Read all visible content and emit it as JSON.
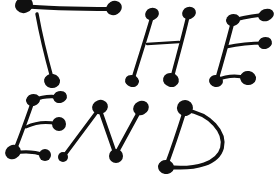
{
  "image": {
    "kind": "hand-drawn-lettering",
    "title": "THE END",
    "width": 274,
    "height": 174,
    "background_color": "#ffffff",
    "ink_color": "#101010",
    "description": "Hand-drawn block lettering reading THE END over two lines, each stroke ending in a thick round blob"
  },
  "text": {
    "line1": "THE",
    "line2": "END",
    "full": "THE END"
  },
  "letters": [
    {
      "char": "T",
      "line": 1,
      "strokes": [
        {
          "name": "t-crossbar",
          "d": "M 24 6 C 50 9, 86 9, 113 9"
        },
        {
          "name": "t-stem",
          "d": "M 37 14 C 41 36, 47 60, 52 78"
        }
      ],
      "nodes": [
        {
          "name": "t-crossbar-left-blob",
          "cx": 24,
          "cy": 5,
          "rx": 9,
          "ry": 8,
          "rot": -18
        },
        {
          "name": "t-crossbar-right-blob",
          "cx": 114,
          "cy": 8,
          "rx": 8,
          "ry": 7,
          "rot": -30
        },
        {
          "name": "t-stem-bottom-blob",
          "cx": 52,
          "cy": 81,
          "rx": 8,
          "ry": 7,
          "rot": 10
        }
      ]
    },
    {
      "char": "H",
      "line": 1,
      "strokes": [
        {
          "name": "h-left-stem",
          "d": "M 152 17 C 146 38, 138 62, 133 79"
        },
        {
          "name": "h-right-stem",
          "d": "M 188 16 C 183 38, 176 62, 172 78"
        },
        {
          "name": "h-crossbar",
          "d": "M 147 44 L 179 42"
        }
      ],
      "nodes": [
        {
          "name": "h-left-top-blob",
          "cx": 152,
          "cy": 14,
          "rx": 7,
          "ry": 6,
          "rot": -20
        },
        {
          "name": "h-right-top-blob",
          "cx": 189,
          "cy": 13,
          "rx": 7,
          "ry": 6,
          "rot": -20
        },
        {
          "name": "h-left-bottom-blob",
          "cx": 132,
          "cy": 81,
          "rx": 7,
          "ry": 6,
          "rot": 15
        },
        {
          "name": "h-right-bottom-blob",
          "cx": 171,
          "cy": 80,
          "rx": 8,
          "ry": 7,
          "rot": 15
        }
      ]
    },
    {
      "char": "E",
      "line": 1,
      "strokes": [
        {
          "name": "e1-spine",
          "d": "M 233 21 C 228 40, 222 62, 217 79"
        },
        {
          "name": "e1-top-arm",
          "d": "M 234 20 C 246 17, 257 15, 265 15"
        },
        {
          "name": "e1-middle-arm",
          "d": "M 226 47 C 240 44, 255 43, 264 43"
        },
        {
          "name": "e1-bottom-arm",
          "d": "M 217 80 C 228 75, 240 76, 247 78"
        }
      ],
      "nodes": [
        {
          "name": "e1-top-corner-blob",
          "cx": 233,
          "cy": 20,
          "rx": 7,
          "ry": 6,
          "rot": -15
        },
        {
          "name": "e1-top-arm-blob",
          "cx": 266,
          "cy": 15,
          "rx": 8,
          "ry": 6,
          "rot": -20
        },
        {
          "name": "e1-middle-arm-blob",
          "cx": 265,
          "cy": 43,
          "rx": 7,
          "ry": 6,
          "rot": -15
        },
        {
          "name": "e1-bottom-corner-blob",
          "cx": 216,
          "cy": 81,
          "rx": 7,
          "ry": 6,
          "rot": 10
        },
        {
          "name": "e1-bottom-arm-blob",
          "cx": 248,
          "cy": 78,
          "rx": 8,
          "ry": 7,
          "rot": 10
        }
      ]
    },
    {
      "char": "E",
      "line": 2,
      "strokes": [
        {
          "name": "e2-spine",
          "d": "M 33 101 C 27 118, 20 138, 14 152"
        },
        {
          "name": "e2-top-arm",
          "d": "M 34 100 C 43 96, 52 96, 59 97"
        },
        {
          "name": "e2-middle-arm",
          "d": "M 26 127 C 37 122, 49 122, 57 124"
        },
        {
          "name": "e2-bottom-arm",
          "d": "M 14 153 C 25 151, 36 152, 44 155"
        }
      ],
      "nodes": [
        {
          "name": "e2-top-corner-blob",
          "cx": 33,
          "cy": 100,
          "rx": 7,
          "ry": 6,
          "rot": -15
        },
        {
          "name": "e2-top-arm-blob",
          "cx": 60,
          "cy": 97,
          "rx": 7,
          "ry": 6,
          "rot": -15
        },
        {
          "name": "e2-middle-arm-blob",
          "cx": 59,
          "cy": 124,
          "rx": 7,
          "ry": 7,
          "rot": 0
        },
        {
          "name": "e2-bottom-corner-blob",
          "cx": 13,
          "cy": 152,
          "rx": 8,
          "ry": 7,
          "rot": -25
        },
        {
          "name": "e2-bottom-arm-blob",
          "cx": 45,
          "cy": 155,
          "rx": 6,
          "ry": 6,
          "rot": 0
        }
      ]
    },
    {
      "char": "N",
      "line": 2,
      "strokes": [
        {
          "name": "n-left-diagonal",
          "d": "M 64 156 L 99 109"
        },
        {
          "name": "n-middle-diagonal",
          "d": "M 100 110 L 115 153"
        },
        {
          "name": "n-right-diagonal",
          "d": "M 116 154 L 140 110"
        }
      ],
      "nodes": [
        {
          "name": "n-bottom-left-blob",
          "cx": 63,
          "cy": 157,
          "rx": 5,
          "ry": 5,
          "rot": 0
        },
        {
          "name": "n-apex-blob",
          "cx": 100,
          "cy": 107,
          "rx": 8,
          "ry": 7,
          "rot": -20
        },
        {
          "name": "n-valley-blob",
          "cx": 116,
          "cy": 156,
          "rx": 7,
          "ry": 7,
          "rot": 0
        },
        {
          "name": "n-top-right-blob",
          "cx": 141,
          "cy": 108,
          "rx": 8,
          "ry": 7,
          "rot": -25
        }
      ]
    },
    {
      "char": "D",
      "line": 2,
      "strokes": [
        {
          "name": "d-spine",
          "d": "M 185 110 C 179 129, 172 150, 166 166"
        },
        {
          "name": "d-bowl",
          "d": "M 186 110 C 210 114, 226 132, 222 148 C 218 163, 197 170, 167 167"
        }
      ],
      "nodes": [
        {
          "name": "d-top-blob",
          "cx": 185,
          "cy": 108,
          "rx": 8,
          "ry": 8,
          "rot": -20
        },
        {
          "name": "d-bottom-blob",
          "cx": 166,
          "cy": 167,
          "rx": 8,
          "ry": 7,
          "rot": 10
        }
      ]
    }
  ],
  "stroke_widths": {
    "thick": 4.6,
    "medium": 4.0,
    "thin": 2.6
  }
}
